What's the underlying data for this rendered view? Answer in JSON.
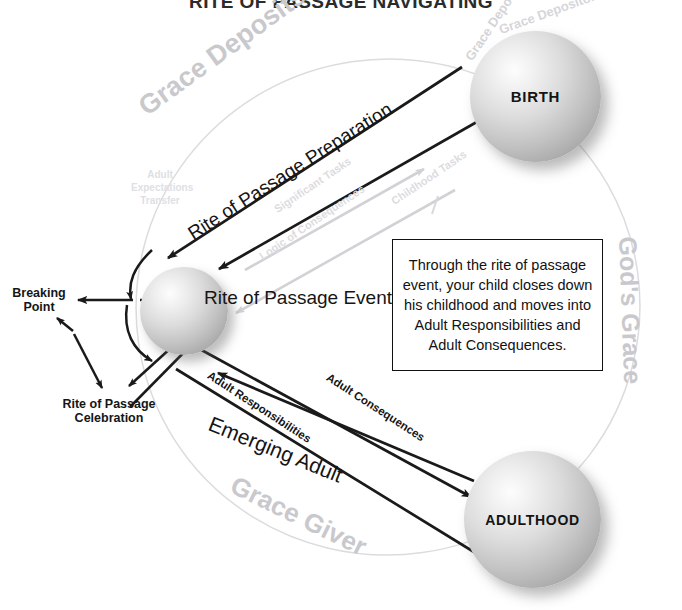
{
  "title": "RITE OF PASSAGE NAVIGATING",
  "nodes": {
    "birth": "BIRTH",
    "adulthood": "ADULTHOOD",
    "rite_of_passage_event": "Rite of Passage Event"
  },
  "labels": {
    "rite_of_passage_preparation": "Rite of Passage Preparation",
    "emerging_adult": "Emerging Adult",
    "adult_responsibilities": "Adult Responsibilities",
    "adult_consequences": "Adult Consequences",
    "breaking_point": "Breaking Point",
    "rite_of_passage_celebration": "Rite of Passage Celebration"
  },
  "watermarks": {
    "grace_deposits": "Grace Deposits",
    "gods_grace": "God's Grace",
    "grace_giver": "Grace Giver",
    "grace_depositors": "Grace Depositors",
    "grace_depositors_2": "Grace Depositors Grace De",
    "adult_expectations": "Adult Expectations Transfer",
    "significant_tasks": "Significant Tasks",
    "childhood_tasks": "Childhood Tasks",
    "logic_of_consequences": "Logic of Consequences"
  },
  "callout": {
    "lines": [
      "Through the rite of passage",
      "event, your child closes down",
      "his childhood and moves into",
      "Adult Responsibilities and",
      "Adult Consequences."
    ]
  },
  "colors": {
    "background": "#ffffff",
    "text": "#151515",
    "sphere_light": "#fdfdfd",
    "sphere_dark": "#949494",
    "ghost_text": "#c9c9cd",
    "arrow": "#1a1a1a",
    "arrow_faded": "#d2d2d6",
    "ellipse_stroke": "#dcdce0",
    "callout_border": "#111111"
  }
}
